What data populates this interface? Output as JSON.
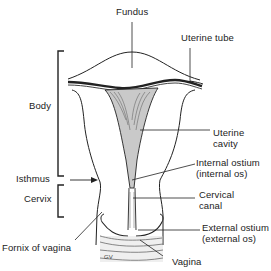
{
  "diagram": {
    "type": "anatomical-illustration",
    "colors": {
      "ink": "#222222",
      "shade": "#b8b8b8",
      "background": "#ffffff"
    },
    "labels": {
      "fundus": "Fundus",
      "uterine_tube": "Uterine tube",
      "body": "Body",
      "uterine_cavity_line1": "Uterine",
      "uterine_cavity_line2": "cavity",
      "internal_ostium_line1": "Internal ostium",
      "internal_ostium_line2": "(internal os)",
      "isthmus": "Isthmus",
      "cervix": "Cervix",
      "cervical_canal_line1": "Cervical",
      "cervical_canal_line2": "canal",
      "external_ostium_line1": "External ostium",
      "external_ostium_line2": "(external os)",
      "fornix_of_vagina": "Fornix of vagina",
      "vagina": "Vagina"
    },
    "brackets": [
      {
        "name": "body",
        "label": "Body"
      },
      {
        "name": "cervix",
        "label": "Cervix"
      }
    ],
    "artist_mark": "GV"
  }
}
